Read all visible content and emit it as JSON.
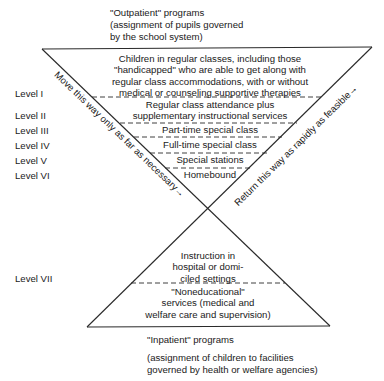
{
  "header": {
    "outpatient_title": "\"Outpatient\" programs",
    "outpatient_sub1": "(assignment of pupils governed",
    "outpatient_sub2": "by the school system)"
  },
  "levels": [
    {
      "label": "Level I",
      "lines": [
        "Children in regular classes, including those",
        "\"handicapped\" who are able to get along with",
        "regular class accommodations, with or without",
        "medical or counseling supportive therapies"
      ]
    },
    {
      "label": "Level II",
      "lines": [
        "Regular class attendance plus",
        "supplementary instructional services"
      ]
    },
    {
      "label": "Level III",
      "lines": [
        "Part-time special class"
      ]
    },
    {
      "label": "Level IV",
      "lines": [
        "Full-time special class"
      ]
    },
    {
      "label": "Level V",
      "lines": [
        "Special stations"
      ]
    },
    {
      "label": "Level VI",
      "lines": [
        "Homebound"
      ]
    },
    {
      "label": "Level VII",
      "lines": [
        "Instruction in",
        "hospital or domi-",
        "ciled settings"
      ]
    }
  ],
  "lower": {
    "noneducational": [
      "\"Noneducational\"",
      "services (medical and",
      "welfare care and supervision)"
    ]
  },
  "arrows": {
    "left": "Move this way only as far as necessary→",
    "right": "Return this way as rapidly as feasible→"
  },
  "footer": {
    "inpatient_title": "\"Inpatient\" programs",
    "inpatient_sub1": "(assignment of children to facilities",
    "inpatient_sub2": "governed by health or welfare agencies)"
  },
  "colors": {
    "line": "#2a2a2a",
    "text": "#1a1a1a",
    "background": "#ffffff"
  }
}
